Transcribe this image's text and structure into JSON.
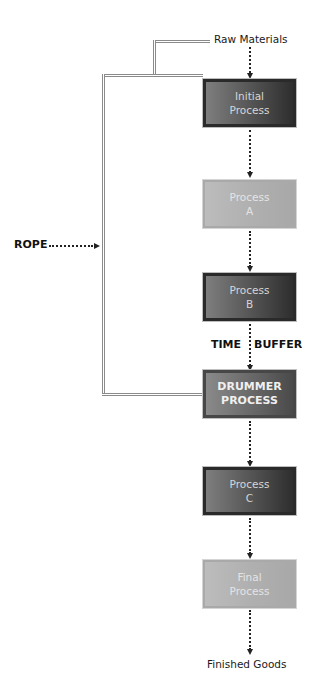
{
  "diagram": {
    "type": "flow",
    "input_label": "Raw Materials",
    "output_label": "Finished Goods",
    "rope_label": "ROPE",
    "buffer_labels": {
      "left": "TIME",
      "right": "BUFFER"
    },
    "nodes": [
      {
        "id": "initial",
        "line1": "Initial",
        "line2": "Process",
        "style": "dark"
      },
      {
        "id": "a",
        "line1": "Process",
        "line2": "A",
        "style": "light"
      },
      {
        "id": "b",
        "line1": "Process",
        "line2": "B",
        "style": "dark"
      },
      {
        "id": "drummer",
        "line1": "DRUMMER",
        "line2": "PROCESS",
        "style": "drummer"
      },
      {
        "id": "c",
        "line1": "Process",
        "line2": "C",
        "style": "dark"
      },
      {
        "id": "final",
        "line1": "Final",
        "line2": "Process",
        "style": "light"
      }
    ],
    "edges": [
      {
        "from": "Raw Materials",
        "to": "initial",
        "style": "dotted-arrow"
      },
      {
        "from": "initial",
        "to": "a",
        "style": "dotted-arrow"
      },
      {
        "from": "a",
        "to": "b",
        "style": "dotted-arrow"
      },
      {
        "from": "b",
        "to": "drummer",
        "style": "dotted-arrow",
        "label": "TIME BUFFER"
      },
      {
        "from": "drummer",
        "to": "c",
        "style": "dotted-arrow"
      },
      {
        "from": "c",
        "to": "final",
        "style": "dotted-arrow"
      },
      {
        "from": "final",
        "to": "Finished Goods",
        "style": "dotted-arrow"
      },
      {
        "from": "drummer",
        "to": "Raw Materials",
        "style": "double-line",
        "label": "ROPE"
      },
      {
        "from": "drummer",
        "to": "initial",
        "style": "double-line"
      }
    ]
  }
}
